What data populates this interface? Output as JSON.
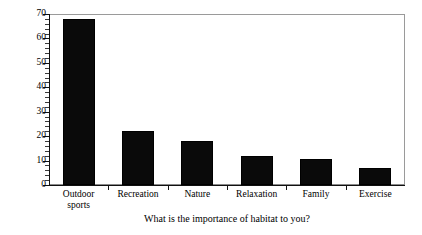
{
  "chart_data": {
    "type": "bar",
    "title": "",
    "subtitle": "",
    "xlabel": "What is the importance of habitat to you?",
    "ylabel": "Percent of respondents",
    "categories": [
      "Outdoor sports",
      "Recreation",
      "Nature",
      "Relaxation",
      "Family",
      "Exercise"
    ],
    "values": [
      68,
      22,
      18,
      12,
      10.5,
      7
    ],
    "ylim": [
      0,
      70
    ],
    "ytick_values": [
      0,
      10,
      20,
      30,
      40,
      50,
      60,
      70
    ],
    "ytick_labels": [
      "0",
      "10",
      "20",
      "30",
      "40",
      "50",
      "60",
      "70"
    ],
    "yminor_interval": 2,
    "grid": false,
    "legend": false,
    "legend_position": "none",
    "bar_color": "#0a0a0a",
    "axis_color": "#111111",
    "frame_color": "#8a8a8a",
    "background_color": "#ffffff"
  },
  "axis": {
    "y_title": "Percent of respondents",
    "x_title": "What is the importance of habitat to you?"
  },
  "x_labels": [
    {
      "line1": "Outdoor",
      "line2": "sports",
      "text": "Outdoor\nsports"
    },
    {
      "line1": "Recreation",
      "line2": "",
      "text": "Recreation"
    },
    {
      "line1": "Nature",
      "line2": "",
      "text": "Nature"
    },
    {
      "line1": "Relaxation",
      "line2": "",
      "text": "Relaxation"
    },
    {
      "line1": "Family",
      "line2": "",
      "text": "Family"
    },
    {
      "line1": "Exercise",
      "line2": "",
      "text": "Exercise"
    }
  ]
}
